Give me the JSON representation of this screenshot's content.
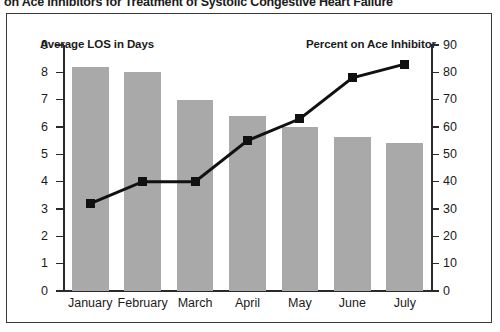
{
  "chart_data": {
    "type": "bar",
    "title": "on Ace Inhibitors for Treatment of Systolic Congestive Heart Failure",
    "categories": [
      "January",
      "February",
      "March",
      "April",
      "May",
      "June",
      "July"
    ],
    "xlabel": "",
    "series": [
      {
        "name": "Average LOS in Days",
        "type": "bar",
        "axis": "left",
        "color": "#a9a9a9",
        "values": [
          8.2,
          8.0,
          7.0,
          6.4,
          6.0,
          5.65,
          5.4
        ]
      },
      {
        "name": "Percent on Ace Inhibitor",
        "type": "line",
        "axis": "right",
        "color": "#111111",
        "marker": "square",
        "values": [
          32,
          40,
          40,
          55,
          63,
          78,
          83
        ]
      }
    ],
    "left_axis": {
      "label": "Average LOS in Days",
      "ylim": [
        0,
        9
      ],
      "ticks": [
        0,
        1,
        2,
        3,
        4,
        5,
        6,
        7,
        8,
        9
      ],
      "tick_labels": [
        "0",
        "1",
        "2",
        "3",
        "4",
        "5",
        "6",
        "7",
        "8",
        "9"
      ]
    },
    "right_axis": {
      "label": "Percent on Ace Inhibitor",
      "ylim": [
        0,
        90
      ],
      "ticks": [
        0,
        10,
        20,
        30,
        40,
        50,
        60,
        70,
        80,
        90
      ],
      "tick_labels": [
        "0",
        "10",
        "20",
        "30",
        "40",
        "50",
        "60",
        "70",
        "80",
        "90"
      ]
    },
    "grid": false,
    "legend_position": "inside-top"
  }
}
